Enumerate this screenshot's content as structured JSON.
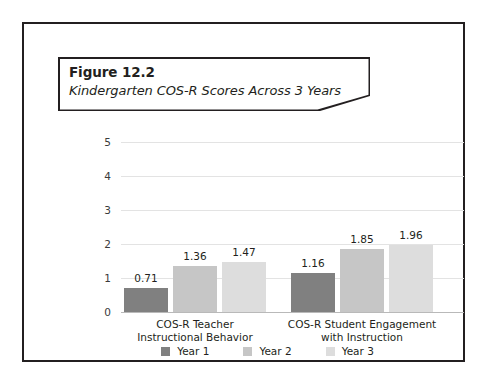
{
  "figure": {
    "number": "Figure 12.2",
    "subtitle": "Kindergarten COS-R Scores Across 3 Years"
  },
  "chart_data": {
    "type": "bar",
    "title": "Kindergarten COS-R Scores Across 3 Years",
    "xlabel": "",
    "ylabel": "",
    "ylim": [
      0,
      5
    ],
    "yticks": [
      "0",
      "1",
      "2",
      "3",
      "4",
      "5"
    ],
    "grid": true,
    "legend_position": "bottom",
    "categories": [
      "COS-R Teacher Instructional Behavior",
      "COS-R Student Engagement with Instruction"
    ],
    "category_lines": [
      [
        "COS-R Teacher",
        "Instructional Behavior"
      ],
      [
        "COS-R Student Engagement",
        "with Instruction"
      ]
    ],
    "series": [
      {
        "name": "Year 1",
        "color": "#808080",
        "values": [
          0.71,
          1.16
        ],
        "labels": [
          "0.71",
          "1.16"
        ]
      },
      {
        "name": "Year 2",
        "color": "#c6c6c6",
        "values": [
          1.36,
          1.85
        ],
        "labels": [
          "1.36",
          "1.85"
        ]
      },
      {
        "name": "Year 3",
        "color": "#dddddd",
        "values": [
          1.47,
          1.96
        ],
        "labels": [
          "1.47",
          "1.96"
        ]
      }
    ]
  },
  "colors": {
    "frame": "#231f20",
    "gridline": "#e3e3e3",
    "baseline": "#b9b9b9",
    "year1": "#808080",
    "year2": "#c6c6c6",
    "year3": "#dddddd"
  }
}
